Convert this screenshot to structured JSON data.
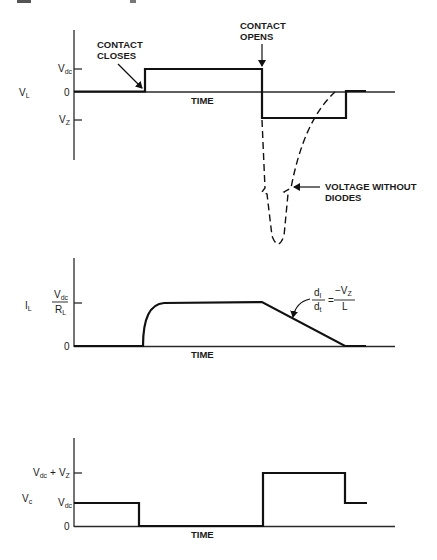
{
  "diagram": {
    "plots": [
      {
        "id": "load-voltage",
        "y_variable": {
          "main": "V",
          "sub": "L"
        },
        "ticks": [
          {
            "main": "V",
            "sub": "dc",
            "level": "Vdc"
          },
          {
            "main": "0",
            "sub": "",
            "level": "0"
          },
          {
            "main": "V",
            "sub": "Z",
            "level": "-Vz"
          }
        ],
        "x_label": "TIME",
        "annotations": [
          {
            "text_line1": "CONTACT",
            "text_line2": "CLOSES"
          },
          {
            "text_line1": "CONTACT",
            "text_line2": "OPENS"
          },
          {
            "text_line1": "VOLTAGE WITHOUT",
            "text_line2": "DIODES"
          }
        ]
      },
      {
        "id": "load-current",
        "y_variable": {
          "main": "I",
          "sub": "L"
        },
        "ticks": [
          {
            "num_main": "V",
            "num_sub": "dc",
            "den_main": "R",
            "den_sub": "L",
            "level": "Vdc/RL"
          },
          {
            "main": "0",
            "level": "0"
          }
        ],
        "x_label": "TIME",
        "annotations": [
          {
            "lhs_num": "d",
            "lhs_num_sub": "I",
            "lhs_den": "d",
            "lhs_den_sub": "t",
            "equals": "=",
            "rhs_num": "−V",
            "rhs_num_sub": "Z",
            "rhs_den": "L"
          }
        ]
      },
      {
        "id": "contact-voltage",
        "y_variable": {
          "main": "V",
          "sub": "c"
        },
        "ticks": [
          {
            "main": "V",
            "sub": "dc",
            "plus": "+",
            "main2": "V",
            "sub2": "Z",
            "level": "Vdc+Vz"
          },
          {
            "main": "V",
            "sub": "dc",
            "level": "Vdc"
          },
          {
            "main": "0",
            "level": "0"
          }
        ],
        "x_label": "TIME"
      }
    ]
  }
}
